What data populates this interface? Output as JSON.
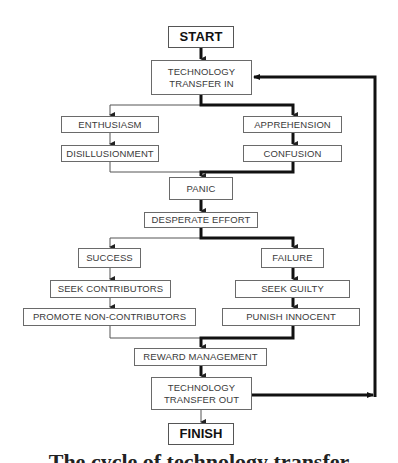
{
  "diagram": {
    "type": "flowchart",
    "nodes": {
      "start": "START",
      "tech_in_1": "TECHNOLOGY",
      "tech_in_2": "TRANSFER IN",
      "enthusiasm": "ENTHUSIASM",
      "apprehension": "APPREHENSION",
      "disillusionment": "DISILLUSIONMENT",
      "confusion": "CONFUSION",
      "panic": "PANIC",
      "desperate_effort": "DESPERATE EFFORT",
      "success": "SUCCESS",
      "failure": "FAILURE",
      "seek_contributors": "SEEK CONTRIBUTORS",
      "seek_guilty": "SEEK GUILTY",
      "promote": "PROMOTE NON-CONTRIBUTORS",
      "punish": "PUNISH INNOCENT",
      "reward": "REWARD MANAGEMENT",
      "tech_out_1": "TECHNOLOGY",
      "tech_out_2": "TRANSFER OUT",
      "finish": "FINISH"
    },
    "edges": [
      [
        "START",
        "TECHNOLOGY TRANSFER IN",
        "thick"
      ],
      [
        "TECHNOLOGY TRANSFER IN",
        "ENTHUSIASM",
        "thin"
      ],
      [
        "TECHNOLOGY TRANSFER IN",
        "APPREHENSION",
        "thick"
      ],
      [
        "ENTHUSIASM",
        "DISILLUSIONMENT",
        "thin"
      ],
      [
        "APPREHENSION",
        "CONFUSION",
        "thick"
      ],
      [
        "DISILLUSIONMENT",
        "PANIC",
        "thin"
      ],
      [
        "CONFUSION",
        "PANIC",
        "thick"
      ],
      [
        "PANIC",
        "DESPERATE EFFORT",
        "thick"
      ],
      [
        "DESPERATE EFFORT",
        "SUCCESS",
        "thin"
      ],
      [
        "DESPERATE EFFORT",
        "FAILURE",
        "thick"
      ],
      [
        "SUCCESS",
        "SEEK CONTRIBUTORS",
        "thin"
      ],
      [
        "FAILURE",
        "SEEK GUILTY",
        "thick"
      ],
      [
        "SEEK CONTRIBUTORS",
        "PROMOTE NON-CONTRIBUTORS",
        "thin"
      ],
      [
        "SEEK GUILTY",
        "PUNISH INNOCENT",
        "thick"
      ],
      [
        "PROMOTE NON-CONTRIBUTORS",
        "REWARD MANAGEMENT",
        "thin"
      ],
      [
        "PUNISH INNOCENT",
        "REWARD MANAGEMENT",
        "thick"
      ],
      [
        "REWARD MANAGEMENT",
        "TECHNOLOGY TRANSFER OUT",
        "thick"
      ],
      [
        "TECHNOLOGY TRANSFER OUT",
        "FINISH",
        "thin"
      ],
      [
        "TECHNOLOGY TRANSFER OUT",
        "TECHNOLOGY TRANSFER IN",
        "thick-loop"
      ]
    ],
    "caption": "The cycle of technology transfer"
  }
}
